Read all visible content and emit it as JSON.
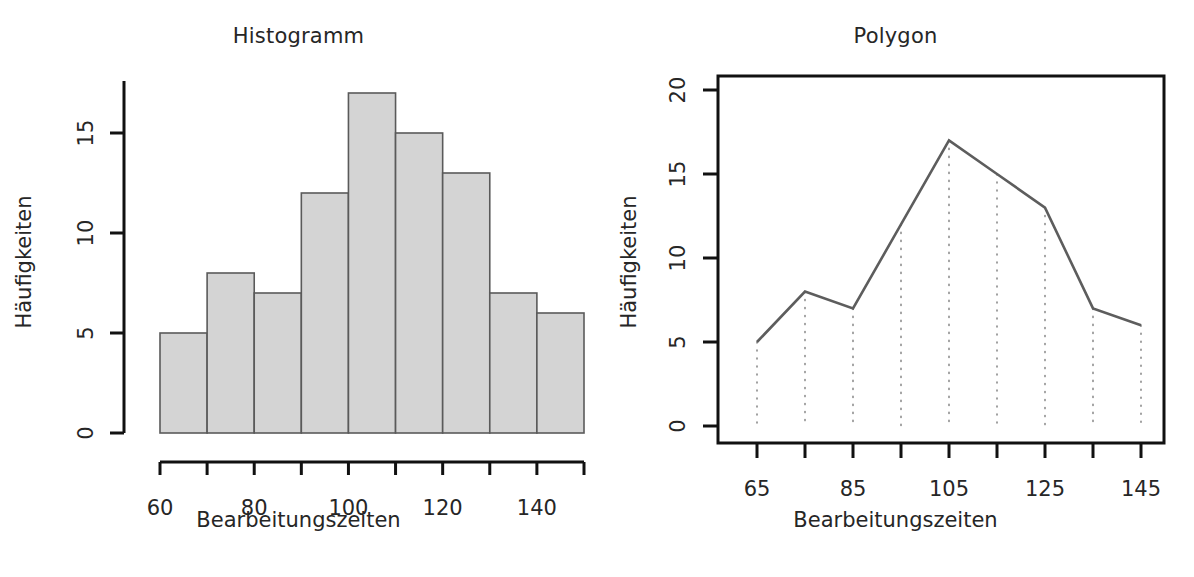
{
  "figure": {
    "background": "#ffffff",
    "ink_color": "#1a1a1a",
    "bar_fill": "#d4d4d4",
    "bar_stroke": "#5a5a5a",
    "line_color": "#5d5d5d",
    "dropline_color": "#8a8a8a"
  },
  "panels": [
    {
      "name": "histogram",
      "title": "Histogramm",
      "xlabel": "Bearbeitungszeiten",
      "ylabel": "Häufigkeiten"
    },
    {
      "name": "polygon",
      "title": "Polygon",
      "xlabel": "Bearbeitungszeiten",
      "ylabel": "Häufigkeiten"
    }
  ],
  "chart_data": [
    {
      "type": "bar",
      "name": "histogram",
      "title": "Histogramm",
      "xlabel": "Bearbeitungszeiten",
      "ylabel": "Häufigkeiten",
      "bin_edges": [
        60,
        70,
        80,
        90,
        100,
        110,
        120,
        130,
        140,
        150
      ],
      "categories": [
        "60-70",
        "70-80",
        "80-90",
        "90-100",
        "100-110",
        "110-120",
        "120-130",
        "130-140",
        "140-150"
      ],
      "values": [
        5,
        8,
        7,
        12,
        17,
        15,
        13,
        7,
        6
      ],
      "xlim": [
        60,
        150
      ],
      "ylim": [
        0,
        17
      ],
      "x_ticks": [
        60,
        70,
        80,
        90,
        100,
        110,
        120,
        130,
        140,
        150
      ],
      "x_tick_labels": [
        "60",
        "",
        "80",
        "",
        "100",
        "",
        "120",
        "",
        "140",
        ""
      ],
      "y_ticks": [
        0,
        5,
        10,
        15
      ],
      "y_tick_labels": [
        "0",
        "5",
        "10",
        "15"
      ],
      "grid": false,
      "legend": "none"
    },
    {
      "type": "line",
      "name": "polygon",
      "title": "Polygon",
      "xlabel": "Bearbeitungszeiten",
      "ylabel": "Häufigkeiten",
      "x": [
        65,
        75,
        85,
        95,
        105,
        115,
        125,
        135,
        145
      ],
      "values": [
        5,
        8,
        7,
        12,
        17,
        15,
        13,
        7,
        6
      ],
      "xlim": [
        60,
        150
      ],
      "ylim": [
        0,
        20.8
      ],
      "x_ticks": [
        65,
        75,
        85,
        95,
        105,
        115,
        125,
        135,
        145
      ],
      "x_tick_labels": [
        "65",
        "",
        "85",
        "",
        "105",
        "",
        "125",
        "",
        "145"
      ],
      "y_ticks": [
        0,
        5,
        10,
        15,
        20
      ],
      "y_tick_labels": [
        "0",
        "5",
        "10",
        "15",
        "20"
      ],
      "grid": false,
      "dropdown_lines": true,
      "legend": "none",
      "box_frame": true
    }
  ]
}
